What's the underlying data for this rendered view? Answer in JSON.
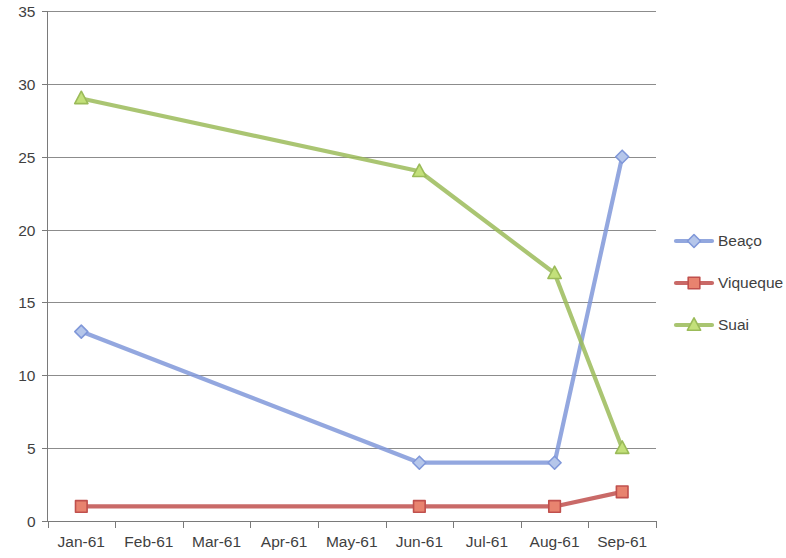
{
  "chart_data": {
    "type": "line",
    "title": "",
    "subtitle": "",
    "xlabel": "",
    "ylabel": "",
    "categories": [
      "Jan-61",
      "Feb-61",
      "Mar-61",
      "Apr-61",
      "May-61",
      "Jun-61",
      "Jul-61",
      "Aug-61",
      "Sep-61"
    ],
    "ylim": [
      0,
      35
    ],
    "ytick_labels": [
      "0",
      "5",
      "10",
      "15",
      "20",
      "25",
      "30",
      "35"
    ],
    "yticks": [
      0,
      5,
      10,
      15,
      20,
      25,
      30,
      35
    ],
    "grid": "horizontal",
    "legend_position": "right",
    "series": [
      {
        "name": "Beaço",
        "color": "#8098d9",
        "marker": "diamond",
        "marker_fill": "#b5c6ea",
        "values": [
          13,
          null,
          null,
          null,
          null,
          4,
          null,
          4,
          25
        ]
      },
      {
        "name": "Viqueque",
        "color": "#c0504d",
        "marker": "square",
        "marker_fill": "#e8836f",
        "values": [
          1,
          null,
          null,
          null,
          null,
          1,
          null,
          1,
          2
        ]
      },
      {
        "name": "Suai",
        "color": "#9bbb59",
        "marker": "triangle",
        "marker_fill": "#c3e07a",
        "values": [
          29,
          null,
          null,
          null,
          null,
          24,
          null,
          17,
          5
        ]
      }
    ]
  },
  "legend": {
    "items": [
      {
        "label": "Beaço"
      },
      {
        "label": "Viqueque"
      },
      {
        "label": "Suai"
      }
    ]
  },
  "axes": {
    "y_labels": [
      "35",
      "30",
      "25",
      "20",
      "15",
      "10",
      "5",
      "0"
    ],
    "x_labels": [
      "Jan-61",
      "Feb-61",
      "Mar-61",
      "Apr-61",
      "May-61",
      "Jun-61",
      "Jul-61",
      "Aug-61",
      "Sep-61"
    ]
  },
  "colors": {
    "series_blue": "#8098d9",
    "series_red": "#c0504d",
    "series_green": "#9bbb59",
    "gridline": "#8c8c8c",
    "axis": "#7a7a7a",
    "text": "#3f3f3f",
    "background": "#ffffff"
  }
}
